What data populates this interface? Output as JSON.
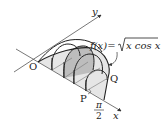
{
  "diagram": {
    "type": "solid-of-revolution-cross-sections",
    "function_label": "f(x)=√(x cos x)",
    "function_parts": {
      "lhs": "f(x)=",
      "radicand": "x cos x"
    },
    "axes": {
      "x_label": "x",
      "y_label": "y"
    },
    "points": {
      "origin": "O",
      "P": "P",
      "Q": "Q"
    },
    "x_end_label": {
      "numerator": "π",
      "denominator": "2"
    },
    "colors": {
      "line": "#222222",
      "fill_light": "#e6e6e6",
      "fill_dark": "#bdbdbd",
      "axis": "#555555"
    }
  }
}
